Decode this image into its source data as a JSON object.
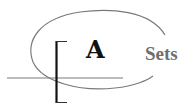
{
  "logo": {
    "letter": "A",
    "word": "Sets",
    "colors": {
      "letter": "#111111",
      "word": "#6f6f6f",
      "ellipse": "#7a7a7a",
      "axis_line": "#7a7a7a",
      "bracket": "#111111",
      "background": "#ffffff"
    }
  }
}
